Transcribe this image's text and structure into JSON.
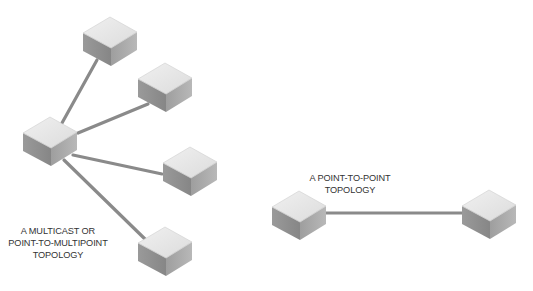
{
  "diagrams": [
    {
      "id": "multicast",
      "label_lines": [
        "A MULTICAST OR",
        "POINT-TO-MULTIPOINT",
        "TOPOLOGY"
      ],
      "nodes": [
        {
          "name": "hub-node",
          "cx": 50,
          "top": 117
        },
        {
          "name": "leaf-node-1",
          "cx": 110,
          "top": 17
        },
        {
          "name": "leaf-node-2",
          "cx": 165,
          "top": 63
        },
        {
          "name": "leaf-node-3",
          "cx": 190,
          "top": 147
        },
        {
          "name": "leaf-node-4",
          "cx": 165,
          "top": 227
        }
      ],
      "links": [
        {
          "from": "hub-node",
          "to": "leaf-node-1",
          "x1": 62,
          "y1": 123,
          "x2": 97,
          "y2": 60
        },
        {
          "from": "hub-node",
          "to": "leaf-node-2",
          "x1": 78,
          "y1": 133,
          "x2": 148,
          "y2": 104
        },
        {
          "from": "hub-node",
          "to": "leaf-node-3",
          "x1": 73,
          "y1": 155,
          "x2": 162,
          "y2": 174
        },
        {
          "from": "hub-node",
          "to": "leaf-node-4",
          "x1": 64,
          "y1": 160,
          "x2": 146,
          "y2": 240
        }
      ]
    },
    {
      "id": "point-to-point",
      "label_lines": [
        "A POINT-TO-POINT",
        "TOPOLOGY"
      ],
      "nodes": [
        {
          "name": "endpoint-node-a",
          "cx": 299,
          "top": 191
        },
        {
          "name": "endpoint-node-b",
          "cx": 489,
          "top": 190
        }
      ],
      "links": [
        {
          "from": "endpoint-node-a",
          "to": "endpoint-node-b",
          "x1": 326,
          "y1": 213,
          "x2": 462,
          "y2": 213
        }
      ]
    }
  ],
  "colors": {
    "link": "#8a8a8a",
    "cube_top": "#e6e6e6",
    "cube_left": "#8e8e8e",
    "cube_right": "#ababab",
    "label_text": "#333333",
    "background": "#ffffff"
  }
}
